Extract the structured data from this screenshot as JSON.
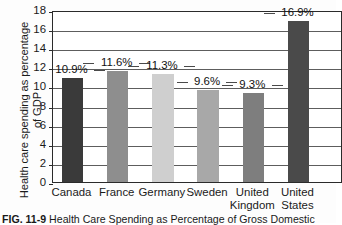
{
  "chart_data": {
    "type": "bar",
    "xlabel": "",
    "ylabel": "Health care spending as percentage of GDP",
    "ylim": [
      0,
      18
    ],
    "ytick_step": 2,
    "grid": true,
    "legend": "none",
    "categories": [
      "Canada",
      "France",
      "Germany",
      "Sweden",
      "United Kingdom",
      "United States"
    ],
    "values": [
      10.9,
      11.6,
      11.3,
      9.6,
      9.3,
      16.9
    ],
    "data_labels": [
      "10.9%",
      "11.6%",
      "11.3%",
      "9.6%",
      "9.3%",
      "16.9%"
    ],
    "bar_colors": [
      "#3a3a3a",
      "#8e8e8e",
      "#cfcfcf",
      "#a8a8a8",
      "#7e7e7e",
      "#4a4a4a"
    ],
    "ytick_labels": [
      "0",
      "2",
      "4",
      "6",
      "8",
      "10",
      "12",
      "14",
      "16",
      "18"
    ]
  },
  "axis": {
    "y_title": "Health care spending as percentage of GDP",
    "y_ticks": [
      {
        "label": "18",
        "value": 18
      },
      {
        "label": "16",
        "value": 16
      },
      {
        "label": "14",
        "value": 14
      },
      {
        "label": "12",
        "value": 12
      },
      {
        "label": "10",
        "value": 10
      },
      {
        "label": "8",
        "value": 8
      },
      {
        "label": "6",
        "value": 6
      },
      {
        "label": "4",
        "value": 4
      },
      {
        "label": "2",
        "value": 2
      },
      {
        "label": "0",
        "value": 0
      }
    ],
    "x_ticks": [
      {
        "label": "Canada"
      },
      {
        "label": "France"
      },
      {
        "label": "Germany"
      },
      {
        "label": "Sweden"
      },
      {
        "label": "United\nKingdom"
      },
      {
        "label": "United\nStates"
      }
    ]
  },
  "bars": [
    {
      "name": "Canada",
      "label": "10.9%",
      "value": 10.9,
      "color": "#3a3a3a"
    },
    {
      "name": "France",
      "label": "11.6%",
      "value": 11.6,
      "color": "#8e8e8e"
    },
    {
      "name": "Germany",
      "label": "11.3%",
      "value": 11.3,
      "color": "#cfcfcf"
    },
    {
      "name": "Sweden",
      "label": "9.6%",
      "value": 9.6,
      "color": "#a8a8a8"
    },
    {
      "name": "United Kingdom",
      "label": "9.3%",
      "value": 9.3,
      "color": "#7e7e7e"
    },
    {
      "name": "United States",
      "label": "16.9%",
      "value": 16.9,
      "color": "#4a4a4a"
    }
  ],
  "caption": {
    "figure_number": "FIG. 11-9",
    "text": "Health Care Spending as Percentage of Gross Domestic"
  }
}
